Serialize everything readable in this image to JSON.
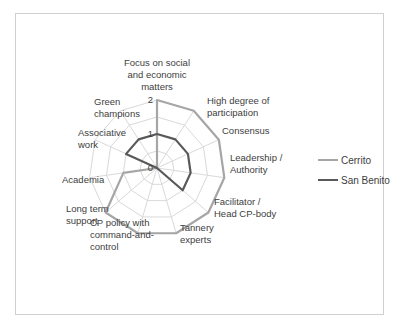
{
  "caption_fragment": "... ...pping ...g...",
  "chart_data": {
    "type": "radar",
    "title": "",
    "categories": [
      "Focus on social and economic matters",
      "High degree of participation",
      "Consensus",
      "Leadership / Authority",
      "Facilitator / Head CP-body",
      "Tannery experts",
      "CP policy with command-and-control",
      "Long term support",
      "Academia",
      "Associative work",
      "Green champions"
    ],
    "series": [
      {
        "name": "Cerrito",
        "color": "#a6a6a6",
        "values": [
          2,
          2,
          2,
          2,
          2,
          2,
          2,
          2,
          1,
          0,
          0
        ]
      },
      {
        "name": "San Benito",
        "color": "#595959",
        "values": [
          1,
          1,
          1,
          1,
          1,
          0,
          0,
          0,
          0,
          1,
          1
        ]
      }
    ],
    "rlim": [
      0,
      2
    ],
    "ticks": [
      "0",
      "1",
      "2"
    ],
    "grid": true,
    "legend_position": "right"
  },
  "axis_labels": [
    [
      "Focus on social",
      "and economic",
      "matters"
    ],
    [
      "High degree of",
      "participation"
    ],
    [
      "Consensus"
    ],
    [
      "Leadership /",
      "Authority"
    ],
    [
      "Facilitator /",
      "Head CP-body"
    ],
    [
      "Tannery",
      "experts"
    ],
    [
      "CP policy with",
      "command-and-",
      "control"
    ],
    [
      "Long term",
      "support"
    ],
    [
      "Academia"
    ],
    [
      "Associative",
      "work"
    ],
    [
      "Green",
      "champions"
    ]
  ],
  "legend": {
    "items": [
      {
        "label": "Cerrito",
        "color": "#a6a6a6"
      },
      {
        "label": "San Benito",
        "color": "#595959"
      }
    ]
  }
}
